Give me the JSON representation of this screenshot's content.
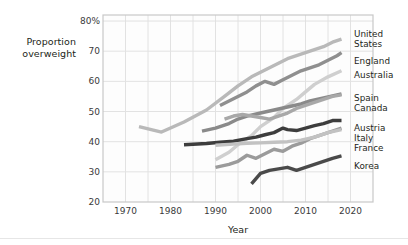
{
  "chart_data": {
    "type": "line",
    "title": "",
    "xlabel": "Year",
    "ylabel": "Proportion overweight",
    "xlim": [
      1965,
      2025
    ],
    "ylim": [
      20,
      82
    ],
    "grid": true,
    "legend_position": "right",
    "y_ticks": [
      "20",
      "30",
      "40",
      "50",
      "60",
      "70",
      "80%"
    ],
    "y_tick_values": [
      20,
      30,
      40,
      50,
      60,
      70,
      80
    ],
    "x_ticks": [
      "1970",
      "1980",
      "1990",
      "2000",
      "2010",
      "2020"
    ],
    "x_tick_values": [
      1970,
      1980,
      1990,
      2000,
      2010,
      2020
    ],
    "series": [
      {
        "name": "United States",
        "color": "#b9b9b9",
        "x": [
          1973,
          1978,
          1983,
          1988,
          1992,
          1995,
          1998,
          2000,
          2002,
          2004,
          2006,
          2008,
          2010,
          2012,
          2014,
          2016,
          2018
        ],
        "values": [
          45.0,
          43.2,
          46.5,
          50.5,
          55.0,
          58.5,
          61.5,
          63.0,
          64.5,
          66.0,
          67.5,
          68.5,
          69.5,
          70.5,
          71.5,
          73.0,
          74.0
        ]
      },
      {
        "name": "England",
        "color": "#8f8f8f",
        "x": [
          1991,
          1993,
          1995,
          1997,
          1999,
          2001,
          2003,
          2005,
          2007,
          2009,
          2011,
          2013,
          2015,
          2017,
          2018
        ],
        "values": [
          52.0,
          53.5,
          55.0,
          56.5,
          58.5,
          60.0,
          59.0,
          60.5,
          62.0,
          63.5,
          64.5,
          65.5,
          67.0,
          68.5,
          69.5
        ]
      },
      {
        "name": "Australia",
        "color": "#cfcfcf",
        "x": [
          1990,
          1993,
          1995,
          1998,
          2000,
          2003,
          2005,
          2008,
          2010,
          2012,
          2015,
          2018
        ],
        "values": [
          34.0,
          36.5,
          39.0,
          42.0,
          45.0,
          48.0,
          51.0,
          54.0,
          56.5,
          59.0,
          61.5,
          63.5
        ]
      },
      {
        "name": "Spain",
        "color": "#8a8a8a",
        "x": [
          1987,
          1990,
          1993,
          1995,
          1997,
          2000,
          2003,
          2006,
          2009,
          2011,
          2014,
          2017,
          2018
        ],
        "values": [
          43.5,
          44.5,
          46.0,
          47.5,
          48.5,
          49.5,
          50.5,
          51.5,
          52.5,
          53.5,
          54.5,
          55.5,
          55.8
        ]
      },
      {
        "name": "Canada",
        "color": "#a8a8a8",
        "x": [
          1992,
          1994,
          1996,
          1998,
          2000,
          2002,
          2004,
          2006,
          2008,
          2010,
          2012,
          2014,
          2016,
          2018
        ],
        "values": [
          47.5,
          48.5,
          49.0,
          48.5,
          48.0,
          47.5,
          48.5,
          49.5,
          51.0,
          52.0,
          53.0,
          54.0,
          55.0,
          55.5
        ]
      },
      {
        "name": "Austria",
        "color": "#3d3d3d",
        "x": [
          1983,
          1988,
          1991,
          1994,
          1997,
          1999,
          2001,
          2003,
          2005,
          2006,
          2008,
          2010,
          2012,
          2014,
          2016,
          2018
        ],
        "values": [
          39.0,
          39.4,
          39.8,
          40.2,
          41.0,
          41.5,
          42.3,
          43.0,
          44.5,
          44.0,
          43.7,
          44.5,
          45.3,
          46.0,
          47.0,
          47.0
        ]
      },
      {
        "name": "Italy",
        "color": "#9b9b9b",
        "x": [
          1990,
          1993,
          1995,
          1997,
          1999,
          2001,
          2003,
          2005,
          2007,
          2009,
          2011,
          2013,
          2015,
          2017,
          2018
        ],
        "values": [
          31.5,
          32.5,
          33.5,
          35.5,
          34.5,
          36.0,
          37.5,
          36.8,
          38.5,
          39.5,
          41.0,
          42.0,
          43.0,
          44.0,
          44.5
        ]
      },
      {
        "name": "France",
        "color": "#c2c2c2",
        "x": [
          1990,
          1994,
          1997,
          2000,
          2003,
          2006,
          2009,
          2012,
          2015,
          2018
        ],
        "values": [
          38.8,
          39.2,
          39.5,
          39.6,
          39.8,
          40.0,
          40.5,
          41.5,
          43.0,
          44.0
        ]
      },
      {
        "name": "Korea",
        "color": "#4a4a4a",
        "x": [
          1998,
          2000,
          2002,
          2004,
          2006,
          2008,
          2010,
          2012,
          2014,
          2016,
          2018
        ],
        "values": [
          26.0,
          29.5,
          30.5,
          31.0,
          31.5,
          30.5,
          31.5,
          32.5,
          33.5,
          34.5,
          35.3
        ]
      }
    ],
    "legend_labels": [
      {
        "text": "United\nStates",
        "top": 30
      },
      {
        "text": "England",
        "top": 57
      },
      {
        "text": "Australia",
        "top": 71
      },
      {
        "text": "Spain",
        "top": 94
      },
      {
        "text": "Canada",
        "top": 104
      },
      {
        "text": "Austria",
        "top": 124
      },
      {
        "text": "Italy",
        "top": 134
      },
      {
        "text": "France",
        "top": 144
      },
      {
        "text": "Korea",
        "top": 162
      }
    ]
  },
  "colors": {
    "grid": "#e2e2e2",
    "frame": "#c8c8c8",
    "text": "#231f20",
    "background": "#ffffff"
  }
}
